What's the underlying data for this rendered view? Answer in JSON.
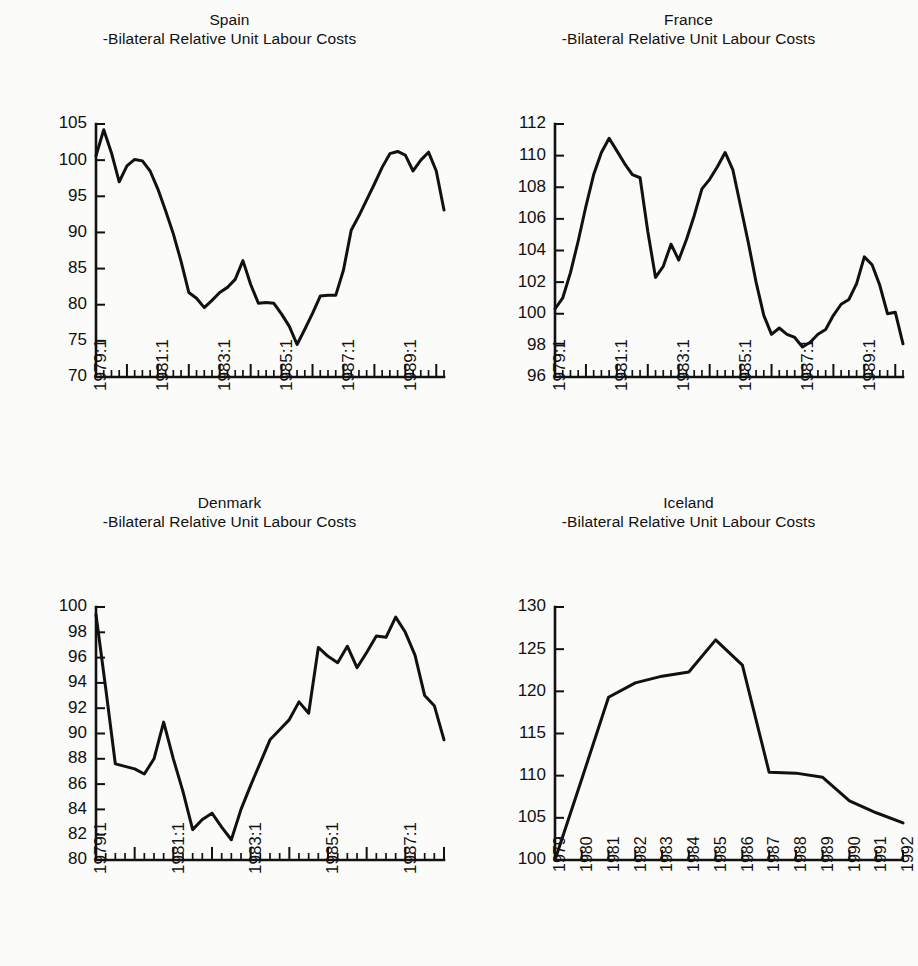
{
  "figure": {
    "subtitle_common": "-Bilateral Relative Unit Labour Costs",
    "background_color": "#fbfbf9",
    "line_color": "#111111"
  },
  "panels": [
    {
      "id": "spain",
      "country": "Spain",
      "subtitle": "-Bilateral Relative Unit Labour Costs"
    },
    {
      "id": "france",
      "country": "France",
      "subtitle": "-Bilateral Relative Unit Labour Costs"
    },
    {
      "id": "denmark",
      "country": "Denmark",
      "subtitle": "-Bilateral Relative Unit Labour Costs"
    },
    {
      "id": "iceland",
      "country": "Iceland",
      "subtitle": "-Bilateral Relative Unit Labour Costs"
    }
  ],
  "chart_data": [
    {
      "id": "spain",
      "type": "line",
      "title": "Spain",
      "subtitle": "-Bilateral Relative Unit Labour Costs",
      "xlabel": "",
      "ylabel": "",
      "ylim": [
        70,
        105
      ],
      "yticks": [
        70,
        75,
        80,
        85,
        90,
        95,
        100,
        105
      ],
      "ytick_labels": [
        "70",
        "75",
        "80",
        "85",
        "90",
        "95",
        "100",
        "105"
      ],
      "x_type": "quarterly",
      "x_start": "1979:1",
      "x_end": "1992:2",
      "xtick_labels": [
        "1979:1",
        "1981:1",
        "1983:1",
        "1985:1",
        "1987:1",
        "1989:1",
        "1991:1"
      ],
      "xtick_every_quarters": 8,
      "grid": false,
      "legend": "none",
      "x": [
        "1979:1",
        "1979:2",
        "1979:3",
        "1979:4",
        "1980:1",
        "1980:2",
        "1980:3",
        "1980:4",
        "1981:1",
        "1981:2",
        "1981:3",
        "1981:4",
        "1982:1",
        "1982:2",
        "1982:3",
        "1982:4",
        "1983:1",
        "1983:2",
        "1983:3",
        "1983:4",
        "1984:1",
        "1984:2",
        "1984:3",
        "1984:4",
        "1985:1",
        "1985:2",
        "1985:3",
        "1985:4",
        "1986:1",
        "1986:2",
        "1986:3",
        "1986:4",
        "1987:1",
        "1987:2",
        "1987:3",
        "1987:4",
        "1988:1",
        "1988:2",
        "1988:3",
        "1988:4",
        "1989:1",
        "1989:2",
        "1989:3",
        "1989:4",
        "1990:1",
        "1990:2",
        "1990:3",
        "1990:4",
        "1991:1",
        "1991:2",
        "1991:3",
        "1991:4",
        "1992:1",
        "1992:2"
      ],
      "values": [
        100.6,
        104.2,
        101.0,
        97.0,
        99.2,
        100.1,
        99.9,
        98.5,
        96.0,
        93.0,
        89.8,
        86.0,
        81.7,
        80.9,
        79.6,
        80.6,
        81.7,
        82.4,
        83.5,
        86.1,
        82.8,
        80.2,
        80.3,
        80.2,
        78.7,
        77.0,
        74.5,
        76.6,
        78.8,
        81.2,
        81.3,
        81.3,
        84.8,
        90.3,
        92.3,
        94.5,
        96.7,
        99.0,
        100.9,
        101.2,
        100.7,
        98.5,
        100.0,
        101.1,
        98.5,
        93.1
      ]
    },
    {
      "id": "france",
      "type": "line",
      "title": "France",
      "subtitle": "-Bilateral Relative Unit Labour Costs",
      "xlabel": "",
      "ylabel": "",
      "ylim": [
        96,
        112
      ],
      "yticks": [
        96,
        98,
        100,
        102,
        104,
        106,
        108,
        110,
        112
      ],
      "ytick_labels": [
        "96",
        "98",
        "100",
        "102",
        "104",
        "106",
        "108",
        "110",
        "112"
      ],
      "x_type": "quarterly",
      "x_start": "1979:1",
      "x_end": "1992:2",
      "xtick_labels": [
        "1979:1",
        "1981:1",
        "1983:1",
        "1985:1",
        "1987:1",
        "1989:1",
        "1991:1"
      ],
      "xtick_every_quarters": 8,
      "grid": false,
      "legend": "none",
      "values": [
        100.3,
        101.0,
        102.6,
        104.6,
        106.8,
        108.8,
        110.2,
        111.1,
        110.3,
        109.5,
        108.8,
        108.6,
        105.2,
        102.3,
        103.0,
        104.4,
        103.4,
        104.7,
        106.2,
        107.9,
        108.5,
        109.3,
        110.2,
        109.1,
        106.8,
        104.5,
        102.0,
        99.9,
        98.7,
        99.1,
        98.7,
        98.5,
        97.9,
        98.2,
        98.7,
        99.0,
        99.9,
        100.6,
        100.9,
        101.9,
        103.6,
        103.1,
        101.8,
        100.0,
        100.1,
        98.1
      ]
    },
    {
      "id": "denmark",
      "type": "line",
      "title": "Denmark",
      "subtitle": "-Bilateral Relative Unit Labour Costs",
      "xlabel": "",
      "ylabel": "",
      "ylim": [
        80,
        100
      ],
      "yticks": [
        80,
        82,
        84,
        86,
        88,
        90,
        92,
        94,
        96,
        98,
        100
      ],
      "ytick_labels": [
        "80",
        "82",
        "84",
        "86",
        "88",
        "90",
        "92",
        "94",
        "96",
        "98",
        "100"
      ],
      "x_type": "quarterly",
      "x_start": "1979:1",
      "x_end": "1992:2",
      "xtick_labels": [
        "1979:1",
        "1981:1",
        "1983:1",
        "1985:1",
        "1987:1",
        "1989:1",
        "1991:1"
      ],
      "xtick_every_quarters": 8,
      "grid": false,
      "legend": "none",
      "values": [
        99.4,
        93.6,
        87.6,
        87.4,
        87.2,
        86.8,
        88.0,
        90.9,
        88.0,
        85.4,
        82.4,
        83.2,
        83.7,
        82.6,
        81.6,
        84.0,
        85.9,
        87.7,
        89.5,
        90.3,
        91.1,
        92.5,
        91.6,
        96.8,
        96.1,
        95.6,
        96.9,
        95.2,
        96.4,
        97.7,
        97.6,
        99.2,
        98.0,
        96.2,
        93.0,
        92.2,
        89.5
      ]
    },
    {
      "id": "iceland",
      "type": "line",
      "title": "Iceland",
      "subtitle": "-Bilateral Relative Unit Labour Costs",
      "xlabel": "",
      "ylabel": "",
      "ylim": [
        100,
        130
      ],
      "yticks": [
        100,
        105,
        110,
        115,
        120,
        125,
        130
      ],
      "ytick_labels": [
        "100",
        "105",
        "110",
        "115",
        "120",
        "125",
        "130"
      ],
      "x_type": "annual",
      "grid": false,
      "legend": "none",
      "categories": [
        "1979",
        "1980",
        "1981",
        "1982",
        "1983",
        "1984",
        "1985",
        "1986",
        "1987",
        "1988",
        "1989",
        "1990",
        "1991",
        "1992"
      ],
      "values": [
        100.0,
        109.6,
        119.3,
        121.0,
        121.8,
        122.3,
        126.1,
        123.1,
        110.4,
        110.3,
        109.8,
        107.0,
        105.6,
        104.4
      ]
    }
  ]
}
